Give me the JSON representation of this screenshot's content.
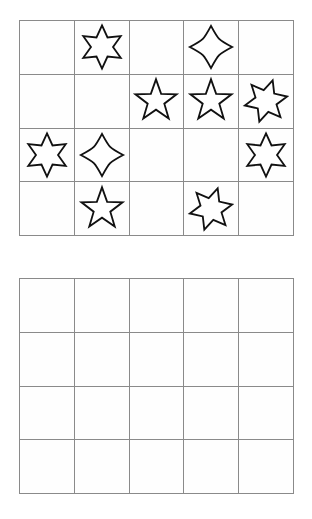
{
  "puzzle": {
    "title": "Star shape grid puzzle",
    "grids": [
      {
        "name": "top-grid",
        "label": "Filled star grid",
        "rows": 4,
        "cols": 5,
        "cells": [
          [
            {
              "shape": "empty",
              "rotation": 0,
              "size": 0
            },
            {
              "shape": "star-6",
              "rotation": 0,
              "size": 46
            },
            {
              "shape": "empty",
              "rotation": 0,
              "size": 0
            },
            {
              "shape": "star-4",
              "rotation": 0,
              "size": 46
            },
            {
              "shape": "empty",
              "rotation": 0,
              "size": 0
            }
          ],
          [
            {
              "shape": "empty",
              "rotation": 0,
              "size": 0
            },
            {
              "shape": "empty",
              "rotation": 0,
              "size": 0
            },
            {
              "shape": "star-5",
              "rotation": 0,
              "size": 46
            },
            {
              "shape": "star-5",
              "rotation": 0,
              "size": 46
            },
            {
              "shape": "star-6",
              "rotation": 18,
              "size": 46
            }
          ],
          [
            {
              "shape": "star-6",
              "rotation": 0,
              "size": 46
            },
            {
              "shape": "star-4",
              "rotation": 0,
              "size": 46
            },
            {
              "shape": "empty",
              "rotation": 0,
              "size": 0
            },
            {
              "shape": "empty",
              "rotation": 0,
              "size": 0
            },
            {
              "shape": "star-6",
              "rotation": 0,
              "size": 46
            }
          ],
          [
            {
              "shape": "empty",
              "rotation": 0,
              "size": 0
            },
            {
              "shape": "star-5",
              "rotation": 0,
              "size": 46
            },
            {
              "shape": "empty",
              "rotation": 0,
              "size": 0
            },
            {
              "shape": "star-6",
              "rotation": 18,
              "size": 46
            },
            {
              "shape": "empty",
              "rotation": 0,
              "size": 0
            }
          ]
        ]
      },
      {
        "name": "bottom-grid",
        "label": "Empty answer grid",
        "rows": 4,
        "cols": 5,
        "cells": [
          [
            {
              "shape": "empty",
              "rotation": 0,
              "size": 0
            },
            {
              "shape": "empty",
              "rotation": 0,
              "size": 0
            },
            {
              "shape": "empty",
              "rotation": 0,
              "size": 0
            },
            {
              "shape": "empty",
              "rotation": 0,
              "size": 0
            },
            {
              "shape": "empty",
              "rotation": 0,
              "size": 0
            }
          ],
          [
            {
              "shape": "empty",
              "rotation": 0,
              "size": 0
            },
            {
              "shape": "empty",
              "rotation": 0,
              "size": 0
            },
            {
              "shape": "empty",
              "rotation": 0,
              "size": 0
            },
            {
              "shape": "empty",
              "rotation": 0,
              "size": 0
            },
            {
              "shape": "empty",
              "rotation": 0,
              "size": 0
            }
          ],
          [
            {
              "shape": "empty",
              "rotation": 0,
              "size": 0
            },
            {
              "shape": "empty",
              "rotation": 0,
              "size": 0
            },
            {
              "shape": "empty",
              "rotation": 0,
              "size": 0
            },
            {
              "shape": "empty",
              "rotation": 0,
              "size": 0
            },
            {
              "shape": "empty",
              "rotation": 0,
              "size": 0
            }
          ],
          [
            {
              "shape": "empty",
              "rotation": 0,
              "size": 0
            },
            {
              "shape": "empty",
              "rotation": 0,
              "size": 0
            },
            {
              "shape": "empty",
              "rotation": 0,
              "size": 0
            },
            {
              "shape": "empty",
              "rotation": 0,
              "size": 0
            },
            {
              "shape": "empty",
              "rotation": 0,
              "size": 0
            }
          ]
        ]
      }
    ],
    "colors": {
      "grid_line": "#8a8a8a",
      "shape_stroke": "#111111",
      "shape_fill": "#ffffff",
      "background": "#ffffff"
    }
  }
}
